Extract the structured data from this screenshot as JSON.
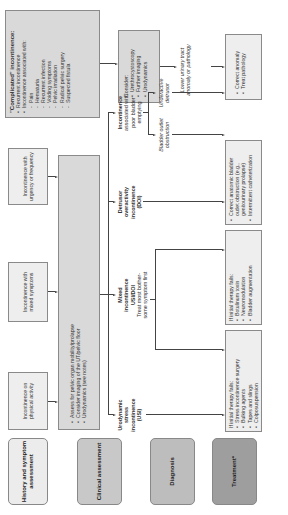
{
  "stages": {
    "history": "History and symptom assessment",
    "clinical": "Clinical assessment",
    "diagnosis": "Diagnosis",
    "treatment": "Treatment*"
  },
  "stage_colors": {
    "history": "#ececec",
    "clinical": "#c8c8c8",
    "diagnosis": "#bdbdbd",
    "treatment": "#9e9e9e"
  },
  "history": {
    "physical": "Incontinence on physical activity",
    "mixed": "Incontinence with mixed symptoms",
    "urgency": "Incontinence with urgency or frequency"
  },
  "complicated": {
    "title": "\"Complicated\" incontinence:",
    "items": [
      "Recurrent incontinence",
      "Incontinence associated with:"
    ],
    "subitems": [
      "Pain",
      "Hematuria",
      "Recurrent infection",
      "Voiding symptoms",
      "Pelvic irradiation",
      "Radical pelvic surgery",
      "Suspected fistula"
    ]
  },
  "assess": {
    "items": [
      "Assess for pelvic organ mobility/prolapse",
      "Consider imaging of the UT/pelvic floor",
      "Urodynamics (see notes)"
    ]
  },
  "consider": {
    "title": "Consider:",
    "items": [
      "Urethrocystoscopy",
      "Further imaging",
      "Urodynamics"
    ]
  },
  "lower_urinary": "Lower urinary tract anomaly or pathology",
  "anomaly": {
    "items": [
      "Correct anomaly",
      "Treat pathology"
    ]
  },
  "diagnosis": {
    "usi": {
      "l1": "Urodynamic",
      "l2": "stress",
      "l3": "incontinence",
      "l4": "(USI)"
    },
    "mixed": {
      "l1": "Mixed",
      "l2": "incontinence",
      "l3": "USI/DOI",
      "note1": "Treat most bother-",
      "note2": "some symptom first"
    },
    "doi": {
      "l1": "Detrusor",
      "l2": "overactivity",
      "l3": "incontinence",
      "l4": "(DOI)"
    },
    "poor": {
      "l1": "Incontinence",
      "l2": "associated with",
      "l3": "poor bladder",
      "l4": "emptying"
    },
    "outlet": "Bladder outlet obstruction",
    "underactive": "Underactive detrusor"
  },
  "treatment": {
    "usi": {
      "title": "If initial therapy fails:",
      "items": [
        "Stress incontinence surgery",
        "Bulking agents",
        "Tapes and slings",
        "Colposuspension"
      ]
    },
    "doi": {
      "title": "If initial therapy fails:",
      "items": [
        "Botulinum toxin",
        "Neuromodulation",
        "Bladder augmentation"
      ]
    },
    "poor": {
      "items": [
        "Correct anatomic bladder outlet obstruction (e.g., genitourinary prolapse)",
        "Intermittent catheterization"
      ]
    }
  }
}
